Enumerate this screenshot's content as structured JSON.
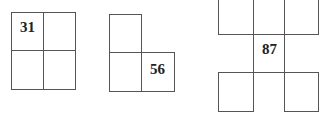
{
  "figures": [
    {
      "name": "figure-1",
      "label": "31",
      "label_cell": "top-left",
      "cells": 4,
      "shape": "2x2 square"
    },
    {
      "name": "figure-2",
      "label": "56",
      "label_cell": "bottom-right",
      "cells": 3,
      "shape": "L-shape"
    },
    {
      "name": "figure-3",
      "label": "87",
      "label_cell": "center",
      "cells": 6,
      "shape": "H-shape"
    }
  ]
}
